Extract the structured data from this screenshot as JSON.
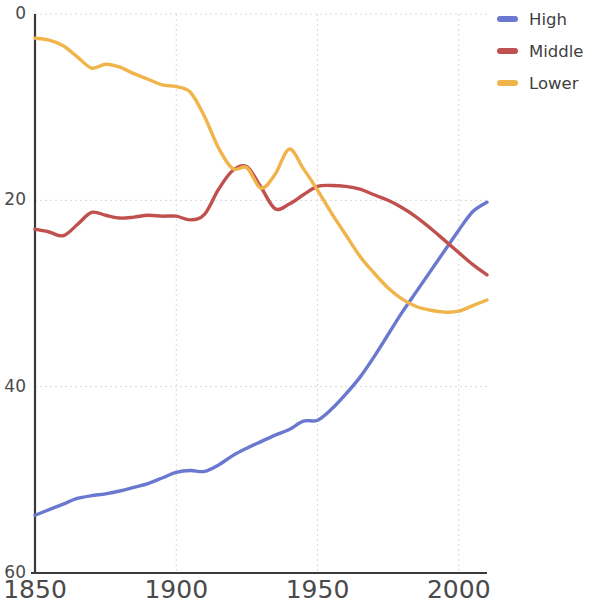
{
  "chart_data": {
    "type": "line",
    "title": "",
    "subtitle": "",
    "xlabel": "",
    "ylabel": "",
    "xlim": [
      1850,
      2010
    ],
    "ylim": [
      0,
      60
    ],
    "x_ticks": [
      1850,
      1900,
      1950,
      2000
    ],
    "y_ticks": [
      0,
      20,
      40,
      60
    ],
    "grid": true,
    "legend_position": "right",
    "series": [
      {
        "name": "High",
        "color": "#6a78cf",
        "x": [
          1850,
          1855,
          1860,
          1865,
          1870,
          1875,
          1880,
          1885,
          1890,
          1895,
          1900,
          1905,
          1910,
          1915,
          1920,
          1925,
          1930,
          1935,
          1940,
          1945,
          1950,
          1955,
          1960,
          1965,
          1970,
          1975,
          1980,
          1985,
          1990,
          1995,
          2000,
          2005,
          2010
        ],
        "values": [
          6.2,
          6.8,
          7.4,
          8.0,
          8.3,
          8.5,
          8.8,
          9.2,
          9.6,
          10.2,
          10.8,
          11.0,
          10.9,
          11.6,
          12.6,
          13.4,
          14.1,
          14.8,
          15.4,
          16.3,
          16.4,
          17.6,
          19.2,
          21.0,
          23.2,
          25.6,
          28.0,
          30.2,
          32.4,
          34.6,
          36.8,
          38.8,
          39.8
        ]
      },
      {
        "name": "Middle",
        "color": "#c0504d",
        "x": [
          1850,
          1855,
          1860,
          1865,
          1870,
          1875,
          1880,
          1885,
          1890,
          1895,
          1900,
          1905,
          1910,
          1915,
          1920,
          1925,
          1930,
          1935,
          1940,
          1945,
          1950,
          1955,
          1960,
          1965,
          1970,
          1975,
          1980,
          1985,
          1990,
          1995,
          2000,
          2005,
          2010
        ],
        "values": [
          36.9,
          36.6,
          36.2,
          37.4,
          38.7,
          38.4,
          38.1,
          38.2,
          38.4,
          38.3,
          38.3,
          37.9,
          38.5,
          41.2,
          43.2,
          43.6,
          41.4,
          39.1,
          39.6,
          40.6,
          41.5,
          41.6,
          41.5,
          41.2,
          40.6,
          40.0,
          39.2,
          38.2,
          37.0,
          35.7,
          34.4,
          33.1,
          32.0
        ]
      },
      {
        "name": "Lower",
        "color": "#f0b44a",
        "x": [
          1850,
          1855,
          1860,
          1865,
          1870,
          1875,
          1880,
          1885,
          1890,
          1895,
          1900,
          1905,
          1910,
          1915,
          1920,
          1925,
          1930,
          1935,
          1940,
          1945,
          1950,
          1955,
          1960,
          1965,
          1970,
          1975,
          1980,
          1985,
          1990,
          1995,
          2000,
          2005,
          2010
        ],
        "values": [
          57.4,
          57.2,
          56.6,
          55.4,
          54.2,
          54.6,
          54.3,
          53.6,
          53.0,
          52.4,
          52.2,
          51.6,
          49.0,
          45.6,
          43.4,
          43.5,
          41.3,
          42.8,
          45.5,
          43.4,
          41.1,
          38.6,
          36.3,
          34.0,
          32.2,
          30.6,
          29.4,
          28.6,
          28.2,
          28.0,
          28.1,
          28.7,
          29.3
        ]
      }
    ]
  },
  "legend": {
    "items": [
      {
        "label": "High",
        "color": "#6a78cf"
      },
      {
        "label": "Middle",
        "color": "#c0504d"
      },
      {
        "label": "Lower",
        "color": "#f0b44a"
      }
    ]
  },
  "axes": {
    "y_tick_labels": [
      "60",
      "40",
      "20",
      "0"
    ],
    "x_tick_labels": [
      "1850",
      "1900",
      "1950",
      "2000"
    ]
  },
  "colors": {
    "grid": "#d8d8d8",
    "axis": "#3a3a3a",
    "text": "#4a4a4a",
    "background": "#ffffff"
  }
}
